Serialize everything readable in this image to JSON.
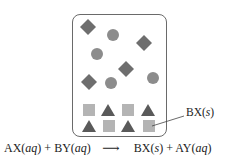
{
  "diagram": {
    "container": "beaker",
    "colors": {
      "diamond": "#6e6e6e",
      "circle": "#8c8c8c",
      "square": "#b4b4b4",
      "triangle": "#5a5a5a",
      "border": "#6a6a6a"
    },
    "diamonds": [
      [
        88,
        27
      ],
      [
        144,
        43
      ],
      [
        126,
        69
      ],
      [
        89,
        81
      ]
    ],
    "circles": [
      [
        113,
        35
      ],
      [
        97,
        54
      ],
      [
        111,
        83
      ],
      [
        153,
        78
      ]
    ],
    "squares": [
      [
        89,
        110
      ],
      [
        126,
        110
      ],
      [
        89,
        126
      ],
      [
        126,
        126
      ],
      [
        146,
        126
      ]
    ],
    "triangles": [
      [
        108,
        110
      ],
      [
        146,
        110
      ],
      [
        89,
        126
      ],
      [
        108,
        126
      ],
      [
        126,
        126
      ]
    ],
    "precipitate_label": "BX(s)",
    "equation": {
      "reactant1": "AX",
      "reactant1_state": "aq",
      "plus1": "+",
      "reactant2": "BY",
      "reactant2_state": "aq",
      "arrow": "⟶",
      "product1": "BX",
      "product1_state": "s",
      "plus2": "+",
      "product2": "AY",
      "product2_state": "aq"
    }
  }
}
